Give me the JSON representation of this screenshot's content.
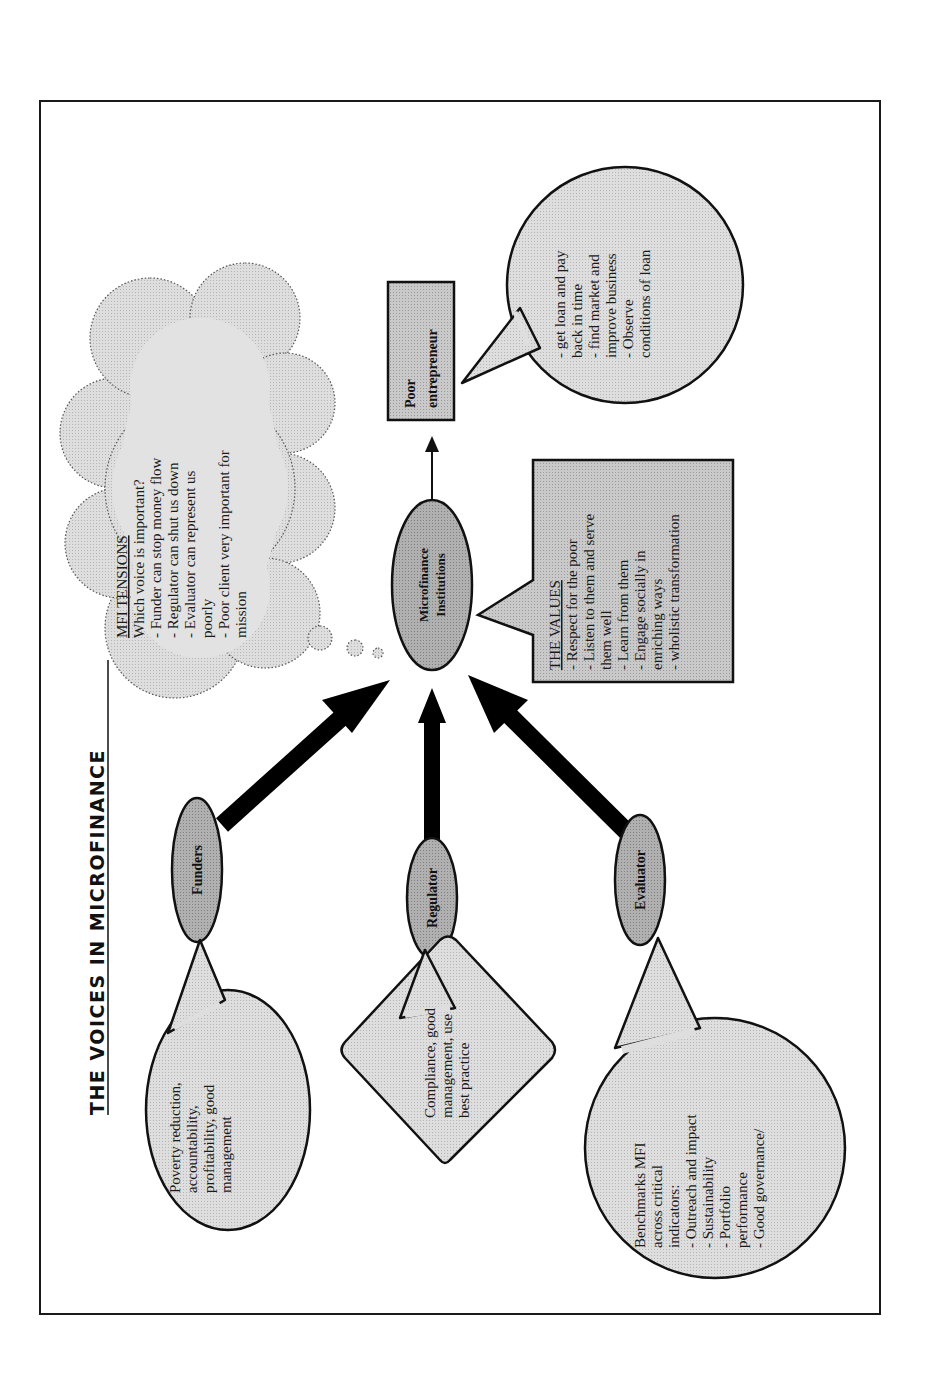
{
  "page": {
    "orientation": "rotated-90-ccw",
    "background": "#ffffff",
    "frame_color": "#1a1a1a"
  },
  "title": "THE VOICES IN MICROFINANCE",
  "colors": {
    "node_fill": "#b8b8b8",
    "bubble_fill": "#d6d6d6",
    "cloud_fill": "#e4e4e4",
    "stroke": "#111111",
    "arrow": "#000000"
  },
  "nodes": {
    "mfi": {
      "line1": "Microfinance",
      "line2": "Institutions"
    },
    "funders": {
      "label": "Funders"
    },
    "regulator": {
      "label": "Regulator"
    },
    "evaluator": {
      "label": "Evaluator"
    },
    "entrepreneur": {
      "line1": "Poor",
      "line2": "entrepreneur"
    }
  },
  "bubbles": {
    "funders": {
      "lines": [
        "Poverty reduction,",
        "accountability,",
        "profitability, good",
        "management"
      ]
    },
    "regulator": {
      "lines": [
        "Compliance, good",
        "management, use",
        "best practice"
      ]
    },
    "evaluator": {
      "lines": [
        "Benchmarks MFI",
        "across critical",
        "indicators:",
        "- Outreach and impact",
        "- Sustainability",
        "- Portfolio",
        "performance",
        "- Good governance/"
      ]
    },
    "entrepreneur": {
      "lines": [
        "- get loan and pay",
        "back in time",
        "- find market and",
        "improve business",
        "- Observe",
        "conditions of loan"
      ]
    },
    "values": {
      "heading": "THE VALUES",
      "lines": [
        "- Respect for the poor",
        "- Listen to them and serve",
        "them well",
        "- Learn from them",
        "- Engage socially in",
        "enriching ways",
        "- wholistic transformation"
      ]
    },
    "tensions": {
      "heading": "MFI TENSIONS",
      "lines": [
        "Which voice is important?",
        "- Funder can stop money flow",
        "- Regulator can shut us down",
        "- Evaluator can represent us",
        "poorly",
        "- Poor client very important for",
        "mission"
      ]
    }
  },
  "arrows": [
    {
      "from": "Funders",
      "to": "Microfinance Institutions",
      "weight": "thick"
    },
    {
      "from": "Regulator",
      "to": "Microfinance Institutions",
      "weight": "thick"
    },
    {
      "from": "Evaluator",
      "to": "Microfinance Institutions",
      "weight": "thick"
    },
    {
      "from": "Microfinance Institutions",
      "to": "Poor entrepreneur",
      "weight": "thin"
    }
  ]
}
